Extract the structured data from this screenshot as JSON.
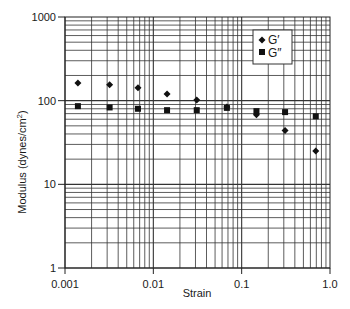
{
  "chart_data": {
    "type": "scatter",
    "title": "",
    "xlabel": "Strain",
    "ylabel": "Modulus (dynes/cm²)",
    "xscale": "log",
    "yscale": "log",
    "xlim": [
      0.001,
      1.0
    ],
    "ylim": [
      1,
      1000
    ],
    "grid": true,
    "legend_position": "upper right",
    "x_tick_labels": [
      "0.001",
      "0.01",
      "0.1",
      "1.0"
    ],
    "x_ticks": [
      0.001,
      0.01,
      0.1,
      1.0
    ],
    "y_tick_labels": [
      "1",
      "10",
      "100",
      "1000"
    ],
    "y_ticks": [
      1,
      10,
      100,
      1000
    ],
    "series": [
      {
        "name": "G′",
        "marker": "diamond",
        "color": "#111111",
        "x": [
          0.0014,
          0.0032,
          0.0067,
          0.0143,
          0.031,
          0.068,
          0.147,
          0.31,
          0.69
        ],
        "values": [
          163,
          155,
          143,
          120,
          102,
          84,
          68,
          44,
          25
        ]
      },
      {
        "name": "G″",
        "marker": "square",
        "color": "#111111",
        "x": [
          0.0014,
          0.0032,
          0.0067,
          0.0143,
          0.031,
          0.068,
          0.147,
          0.31,
          0.69
        ],
        "values": [
          86,
          83,
          80,
          77,
          77,
          82,
          75,
          73,
          65
        ]
      }
    ]
  },
  "legend": {
    "items": [
      {
        "label": "G′",
        "marker": "diamond"
      },
      {
        "label": "G″",
        "marker": "square"
      }
    ]
  },
  "axes": {
    "xlabel": "Strain",
    "ylabel_main": "Modulus (dynes/cm",
    "ylabel_sup": "2",
    "ylabel_close": ")"
  }
}
